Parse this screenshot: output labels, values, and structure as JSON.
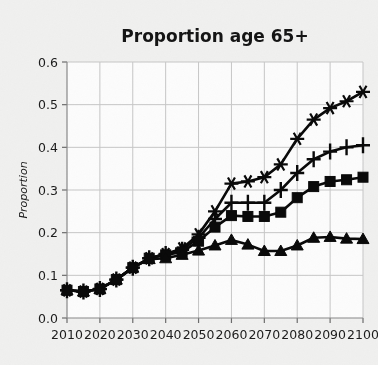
{
  "chart_data": {
    "type": "line",
    "title": "Proportion age 65+",
    "xlabel": "",
    "ylabel": "Proportion",
    "xlim": [
      2010,
      2100
    ],
    "ylim": [
      0.0,
      0.6
    ],
    "yticks": [
      "0.0",
      "0.1",
      "0.2",
      "0.3",
      "0.4",
      "0.5",
      "0.6"
    ],
    "ytick_values": [
      0.0,
      0.1,
      0.2,
      0.3,
      0.4,
      0.5,
      0.6
    ],
    "xticks": [
      "2010",
      "2020",
      "2030",
      "2040",
      "2050",
      "2060",
      "2070",
      "2080",
      "2090",
      "2100"
    ],
    "xtick_values": [
      2010,
      2020,
      2030,
      2040,
      2050,
      2060,
      2070,
      2080,
      2090,
      2100
    ],
    "grid": true,
    "legend": "none",
    "line_color": "#0a0a0a",
    "x": [
      2010,
      2015,
      2020,
      2025,
      2030,
      2035,
      2040,
      2045,
      2050,
      2055,
      2060,
      2065,
      2070,
      2075,
      2080,
      2085,
      2090,
      2095,
      2100
    ],
    "series": [
      {
        "name": "series-star",
        "marker": "star",
        "values": [
          0.065,
          0.062,
          0.068,
          0.09,
          0.118,
          0.14,
          0.15,
          0.163,
          0.196,
          0.25,
          0.315,
          0.32,
          0.33,
          0.36,
          0.42,
          0.465,
          0.492,
          0.508,
          0.53
        ]
      },
      {
        "name": "series-plus",
        "marker": "plus",
        "values": [
          0.065,
          0.062,
          0.068,
          0.09,
          0.118,
          0.14,
          0.15,
          0.16,
          0.188,
          0.232,
          0.27,
          0.27,
          0.27,
          0.3,
          0.34,
          0.372,
          0.39,
          0.4,
          0.405
        ]
      },
      {
        "name": "series-square",
        "marker": "square",
        "values": [
          0.065,
          0.062,
          0.068,
          0.09,
          0.118,
          0.14,
          0.148,
          0.155,
          0.18,
          0.213,
          0.24,
          0.238,
          0.238,
          0.248,
          0.282,
          0.308,
          0.32,
          0.324,
          0.33
        ]
      },
      {
        "name": "series-triangle",
        "marker": "triangle",
        "values": [
          0.065,
          0.062,
          0.068,
          0.09,
          0.118,
          0.138,
          0.14,
          0.148,
          0.158,
          0.17,
          0.183,
          0.172,
          0.157,
          0.157,
          0.17,
          0.188,
          0.19,
          0.186,
          0.185
        ]
      }
    ]
  }
}
